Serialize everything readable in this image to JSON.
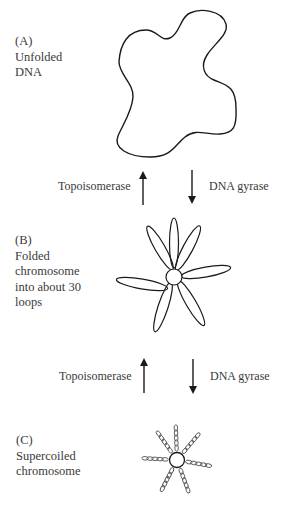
{
  "diagram": {
    "stages": [
      {
        "id": "A",
        "tag": "(A)",
        "lines": [
          "Unfolded",
          "DNA"
        ]
      },
      {
        "id": "B",
        "tag": "(B)",
        "lines": [
          "Folded",
          "chromosome",
          "into about 30",
          "loops"
        ]
      },
      {
        "id": "C",
        "tag": "(C)",
        "lines": [
          "Supercoiled",
          "chromosome"
        ]
      }
    ],
    "transitions": [
      {
        "between": "A-B",
        "up_enzyme": "Topoisomerase",
        "down_enzyme": "DNA gyrase"
      },
      {
        "between": "B-C",
        "up_enzyme": "Topoisomerase",
        "down_enzyme": "DNA gyrase"
      }
    ],
    "colors": {
      "stroke": "#1a1a1a",
      "text": "#3a3a3a",
      "coil": "#555555",
      "background": "#ffffff"
    }
  }
}
